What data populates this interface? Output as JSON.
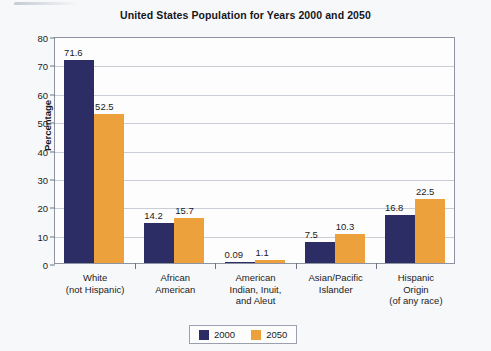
{
  "chart_data": {
    "type": "bar",
    "title": "United States Population for Years 2000 and 2050",
    "xlabel": "",
    "ylabel": "Percentage",
    "ylim": [
      0,
      80
    ],
    "ytick_step": 10,
    "yticks": [
      "0",
      "10",
      "20",
      "30",
      "40",
      "50",
      "60",
      "70",
      "80"
    ],
    "grid": true,
    "legend_position": "bottom-center",
    "categories": [
      "White\n(not Hispanic)",
      "African\nAmerican",
      "American\nIndian, Inuit,\nand Aleut",
      "Asian/Pacific\nIslander",
      "Hispanic\nOrigin\n(of any race)"
    ],
    "series": [
      {
        "name": "2000",
        "color": "#2b2d64",
        "values": [
          71.6,
          14.2,
          0.09,
          7.5,
          16.8
        ],
        "value_labels": [
          "71.6",
          "14.2",
          "0.09",
          "7.5",
          "16.8"
        ]
      },
      {
        "name": "2050",
        "color": "#eda13c",
        "values": [
          52.5,
          15.7,
          1.1,
          10.3,
          22.5
        ],
        "value_labels": [
          "52.5",
          "15.7",
          "1.1",
          "10.3",
          "22.5"
        ]
      }
    ]
  },
  "legend": {
    "entries": [
      {
        "label": "2000",
        "color": "#2b2d64"
      },
      {
        "label": "2050",
        "color": "#eda13c"
      }
    ]
  },
  "colors": {
    "series_2000": "#2b2d64",
    "series_2050": "#eda13c",
    "background": "#f7f8fa",
    "gridline": "#c9cdd6",
    "axis": "#8d93a1"
  }
}
